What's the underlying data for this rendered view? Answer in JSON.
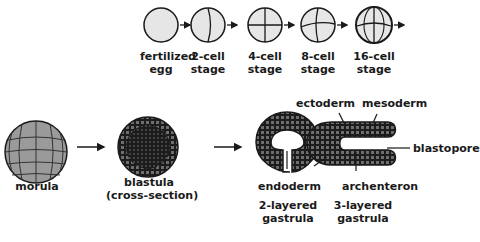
{
  "top_row": {
    "stages": [
      {
        "label_line1": "fertilized",
        "label_line2": "egg"
      },
      {
        "label_line1": "2-cell",
        "label_line2": "stage"
      },
      {
        "label_line1": "4-cell",
        "label_line2": "stage"
      },
      {
        "label_line1": "8-cell",
        "label_line2": "stage"
      },
      {
        "label_line1": "16-cell",
        "label_line2": "stage"
      }
    ]
  },
  "bottom_row": {
    "morula": "morula",
    "blastula_line1": "blastula",
    "blastula_line2": "(cross-section)",
    "ectoderm": "ectoderm",
    "mesoderm": "mesoderm",
    "blastopore": "blastopore",
    "endoderm": "endoderm",
    "archenteron": "archenteron",
    "gastrula2_line1": "2-layered",
    "gastrula2_line2": "gastrula",
    "gastrula3_line1": "3-layered",
    "gastrula3_line2": "gastrula"
  },
  "colors": {
    "cell_fill": "#e6e6e6",
    "outline": "#1a1a1a",
    "morula_fill": "#9a9a9a",
    "dark_tissue": "#1c1c1c"
  }
}
